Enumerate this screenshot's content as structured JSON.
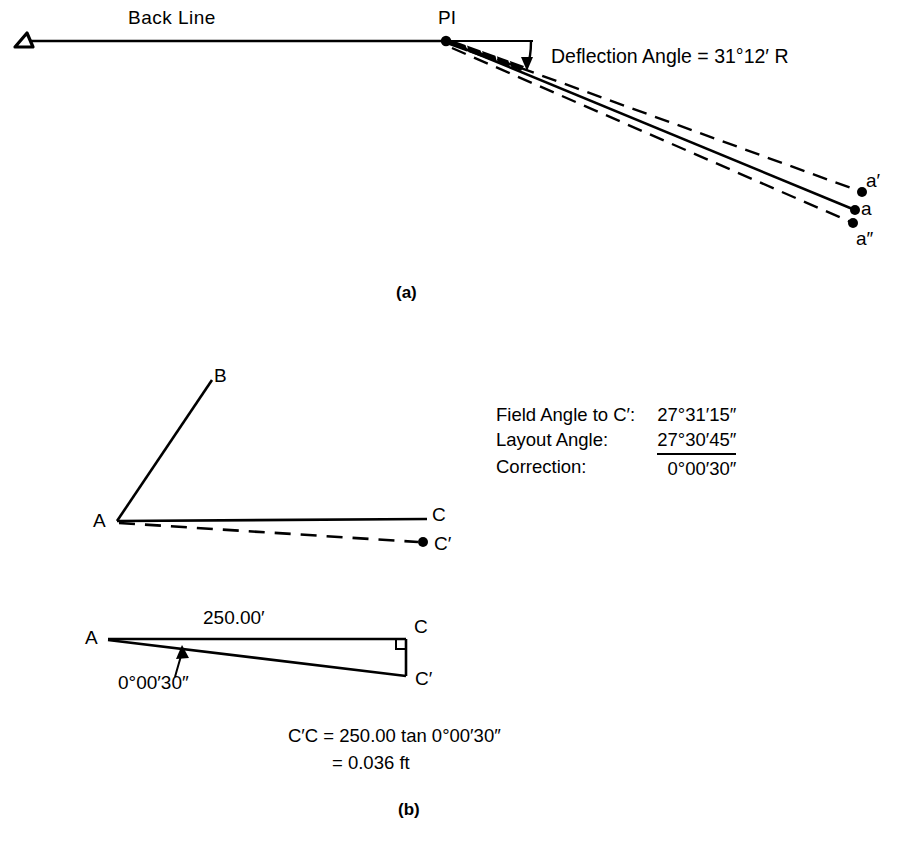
{
  "figure": {
    "panel_a": {
      "caption": "(a)",
      "back_line_label": "Back Line",
      "pi_label": "PI",
      "deflection_text": "Deflection Angle = 31°12′ R",
      "deflection_angle": "31°12′",
      "deflection_direction": "R",
      "endpoint_labels": {
        "upper": "a′",
        "middle": "a",
        "lower": "a″"
      },
      "station_symbol": "triangle-station-marker"
    },
    "panel_b": {
      "caption": "(b)",
      "upper_diagram": {
        "vertex_label": "A",
        "ray_b_label": "B",
        "ray_c_label": "C",
        "ray_cprime_label": "C′"
      },
      "angle_table": {
        "rows": [
          {
            "label": "Field Angle to C′:",
            "value": "27°31′15″",
            "ruled": false
          },
          {
            "label": "Layout Angle:",
            "value": "27°30′45″",
            "ruled": true
          },
          {
            "label": "Correction:",
            "value": "0°00′30″",
            "ruled": false
          }
        ]
      },
      "lower_diagram": {
        "vertex_label": "A",
        "corner_c_label": "C",
        "corner_cprime_label": "C′",
        "distance_label": "250.00′",
        "angle_label": "0°00′30″",
        "right_angle_marker": "right-angle-square"
      },
      "formula": {
        "line1": "C′C = 250.00 tan 0°00′30″",
        "line2": "= 0.036 ft"
      }
    }
  },
  "style": {
    "ink": "#000000",
    "paper": "#ffffff"
  }
}
